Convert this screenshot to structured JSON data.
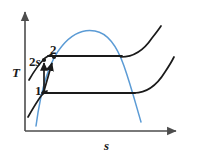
{
  "figure": {
    "kind": "thermodynamic-ts-diagram",
    "background_color": "#ffffff",
    "width": 197,
    "height": 162
  },
  "axes": {
    "y_label": "T",
    "x_label": "s",
    "y_axis_name": "temperature-axis",
    "x_axis_name": "entropy-axis",
    "color": "#4d4d4d",
    "origin": {
      "x": 25,
      "y": 131
    },
    "y_tip": {
      "x": 25,
      "y": 10
    },
    "x_tip": {
      "x": 178,
      "y": 131
    }
  },
  "curves": {
    "saturation_dome": {
      "label": "saturation-dome",
      "color": "#5b9bd5",
      "path": "M 36,126 C 40,96 48,62 62,46 C 72,34 84,29 95,31 C 107,33 117,46 124,66 C 131,86 136,105 141,122"
    },
    "upper_isobar": {
      "label": "upper-isobar-right",
      "color": "#1a1a1a",
      "path": "M 121,57 C 133,57 144,50 152,38 C 156,33 159,29 161,26"
    },
    "lower_isobar": {
      "label": "lower-isobar-right",
      "color": "#1a1a1a",
      "path": "M 134,93 C 146,93 157,85 165,72 C 169,66 172,61 174,57"
    },
    "left_isobar_upper": {
      "label": "left-isobar-upper",
      "color": "#1a1a1a",
      "path": "M 29,80 C 33,73 38,65 45,58 C 48,56 50,55 52,54"
    },
    "left_isobar_lower": {
      "label": "left-isobar-lower",
      "color": "#1a1a1a",
      "path": "M 28,117 C 32,110 36,103 41,96 C 43,94 45,92 47,91"
    },
    "upper_pressure_line": {
      "label": "upper-constant-pressure-line",
      "color": "#1a1a1a",
      "from": {
        "x": 48,
        "y": 56
      },
      "to": {
        "x": 122,
        "y": 56
      }
    },
    "lower_pressure_line": {
      "label": "lower-constant-pressure-line",
      "color": "#1a1a1a",
      "from": {
        "x": 42,
        "y": 93
      },
      "to": {
        "x": 135,
        "y": 93
      }
    }
  },
  "processes": [
    {
      "name": "isentropic-compression-1-to-2s",
      "from": {
        "x": 44,
        "y": 91
      },
      "to": {
        "x": 44,
        "y": 60
      },
      "color": "#1a1a1a",
      "arrow": true
    },
    {
      "name": "actual-compression-1-to-2",
      "from": {
        "x": 44,
        "y": 91
      },
      "to": {
        "x": 53,
        "y": 59
      },
      "color": "#1a1a1a",
      "arrow": true
    }
  ],
  "points": [
    {
      "name": "state-point-1",
      "label": "1",
      "x": 44,
      "y": 92,
      "color": "#1a1a1a"
    },
    {
      "name": "state-point-2s",
      "label": "2s",
      "x": 44,
      "y": 59,
      "color": "#1a1a1a"
    },
    {
      "name": "state-point-2",
      "label": "2",
      "x": 54,
      "y": 57,
      "color": "#1a1a1a"
    }
  ],
  "labels": {
    "state_1": "1",
    "state_2": "2",
    "state_2s_number": "2",
    "state_2s_suffix": "s"
  },
  "colors": {
    "dome_blue": "#5b9bd5",
    "ink_black": "#1a1a1a",
    "axis_gray": "#4d4d4d",
    "paper_white": "#ffffff"
  }
}
